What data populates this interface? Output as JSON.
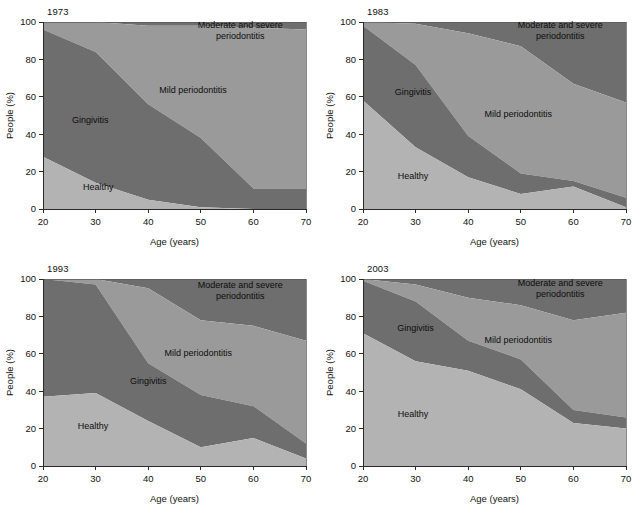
{
  "figure": {
    "panels_order": [
      "1973",
      "1983",
      "1993",
      "2003"
    ],
    "footer_note": ""
  },
  "axes": {
    "xlabel": "Age (years)",
    "ylabel": "People (%)",
    "xticks": [
      "20",
      "30",
      "40",
      "50",
      "60",
      "70"
    ],
    "yticks": [
      "0",
      "20",
      "40",
      "60",
      "80",
      "100"
    ],
    "xlim": [
      20,
      70
    ],
    "ylim": [
      0,
      100
    ]
  },
  "series_labels": {
    "healthy": "Healthy",
    "gingivitis": "Gingivitis",
    "mild": "Mild periodontitis",
    "moderate_line1": "Moderate and severe",
    "moderate_line2": "periodontitis"
  },
  "colors": {
    "healthy": "#b3b3b3",
    "gingivitis": "#6e6e6e",
    "mild": "#9a9a9a",
    "moderate": "#6e6e6e",
    "axis": "#2a2a2a",
    "text": "#111111",
    "background": "#ffffff"
  },
  "chart_data": [
    {
      "type": "area",
      "title": "1973",
      "xlabel": "Age (years)",
      "ylabel": "People (%)",
      "xlim": [
        20,
        70
      ],
      "ylim": [
        0,
        100
      ],
      "grid": false,
      "legend": "inline-area-labels",
      "x": [
        20,
        30,
        40,
        50,
        60,
        70
      ],
      "series": [
        {
          "name": "Healthy",
          "values": [
            28,
            14,
            5,
            1,
            0,
            0
          ]
        },
        {
          "name": "Gingivitis",
          "values": [
            68,
            70,
            51,
            37,
            11,
            11
          ]
        },
        {
          "name": "Mild periodontitis",
          "values": [
            4,
            16,
            42,
            60,
            86,
            85
          ]
        },
        {
          "name": "Moderate and severe periodontitis",
          "values": [
            0,
            0,
            2,
            2,
            3,
            4
          ]
        }
      ],
      "cumulative_top_boundaries": {
        "healthy_top": [
          28,
          14,
          5,
          1,
          0,
          0
        ],
        "gingivitis_top": [
          96,
          84,
          56,
          38,
          11,
          11
        ],
        "mild_top": [
          100,
          100,
          98,
          98,
          97,
          96
        ]
      }
    },
    {
      "type": "area",
      "title": "1983",
      "xlabel": "Age (years)",
      "ylabel": "People (%)",
      "xlim": [
        20,
        70
      ],
      "ylim": [
        0,
        100
      ],
      "grid": false,
      "legend": "inline-area-labels",
      "x": [
        20,
        30,
        40,
        50,
        60,
        70
      ],
      "series": [
        {
          "name": "Healthy",
          "values": [
            58,
            33,
            17,
            8,
            12,
            1
          ]
        },
        {
          "name": "Gingivitis",
          "values": [
            40,
            44,
            22,
            11,
            3,
            5
          ]
        },
        {
          "name": "Mild periodontitis",
          "values": [
            2,
            22,
            55,
            68,
            52,
            51
          ]
        },
        {
          "name": "Moderate and severe periodontitis",
          "values": [
            0,
            1,
            6,
            13,
            33,
            43
          ]
        }
      ],
      "cumulative_top_boundaries": {
        "healthy_top": [
          58,
          33,
          17,
          8,
          12,
          1
        ],
        "gingivitis_top": [
          98,
          77,
          39,
          19,
          15,
          6
        ],
        "mild_top": [
          100,
          99,
          94,
          87,
          67,
          57
        ]
      }
    },
    {
      "type": "area",
      "title": "1993",
      "xlabel": "Age (years)",
      "ylabel": "People (%)",
      "xlim": [
        20,
        70
      ],
      "ylim": [
        0,
        100
      ],
      "grid": false,
      "legend": "inline-area-labels",
      "x": [
        20,
        30,
        40,
        50,
        60,
        70
      ],
      "series": [
        {
          "name": "Healthy",
          "values": [
            37,
            39,
            24,
            10,
            15,
            4
          ]
        },
        {
          "name": "Gingivitis",
          "values": [
            63,
            58,
            31,
            28,
            17,
            8
          ]
        },
        {
          "name": "Mild periodontitis",
          "values": [
            0,
            3,
            40,
            40,
            43,
            55
          ]
        },
        {
          "name": "Moderate and severe periodontitis",
          "values": [
            0,
            0,
            5,
            22,
            25,
            33
          ]
        }
      ],
      "cumulative_top_boundaries": {
        "healthy_top": [
          37,
          39,
          24,
          10,
          15,
          4
        ],
        "gingivitis_top": [
          100,
          97,
          55,
          38,
          32,
          12
        ],
        "mild_top": [
          100,
          100,
          95,
          78,
          75,
          67
        ]
      }
    },
    {
      "type": "area",
      "title": "2003",
      "xlabel": "Age (years)",
      "ylabel": "People (%)",
      "xlim": [
        20,
        70
      ],
      "ylim": [
        0,
        100
      ],
      "grid": false,
      "legend": "inline-area-labels",
      "x": [
        20,
        30,
        40,
        50,
        60,
        70
      ],
      "series": [
        {
          "name": "Healthy",
          "values": [
            71,
            56,
            51,
            41,
            23,
            20
          ]
        },
        {
          "name": "Gingivitis",
          "values": [
            28,
            32,
            16,
            16,
            7,
            6
          ]
        },
        {
          "name": "Mild periodontitis",
          "values": [
            1,
            9,
            23,
            29,
            48,
            56
          ]
        },
        {
          "name": "Moderate and severe periodontitis",
          "values": [
            0,
            3,
            10,
            14,
            22,
            18
          ]
        }
      ],
      "cumulative_top_boundaries": {
        "healthy_top": [
          71,
          56,
          51,
          41,
          23,
          20
        ],
        "gingivitis_top": [
          99,
          88,
          67,
          57,
          30,
          26
        ],
        "mild_top": [
          100,
          97,
          90,
          86,
          78,
          82
        ]
      }
    }
  ],
  "label_positions": [
    {
      "panel": "1973",
      "healthy": {
        "x": 30.5,
        "y": 10
      },
      "gingivitis": {
        "x": 29.0,
        "y": 46
      },
      "mild": {
        "x": 48.5,
        "y": 62
      },
      "moderate": {
        "x": 57.5,
        "y": 97
      }
    },
    {
      "panel": "1983",
      "healthy": {
        "x": 29.5,
        "y": 16
      },
      "gingivitis": {
        "x": 29.5,
        "y": 61
      },
      "mild": {
        "x": 49.5,
        "y": 49
      },
      "moderate": {
        "x": 57.5,
        "y": 97
      }
    },
    {
      "panel": "1993",
      "healthy": {
        "x": 29.5,
        "y": 20
      },
      "gingivitis": {
        "x": 40.0,
        "y": 44
      },
      "mild": {
        "x": 49.5,
        "y": 59
      },
      "moderate": {
        "x": 57.5,
        "y": 95
      }
    },
    {
      "panel": "2003",
      "healthy": {
        "x": 29.5,
        "y": 26
      },
      "gingivitis": {
        "x": 30.0,
        "y": 72
      },
      "mild": {
        "x": 49.5,
        "y": 66
      },
      "moderate": {
        "x": 57.5,
        "y": 96
      }
    }
  ]
}
